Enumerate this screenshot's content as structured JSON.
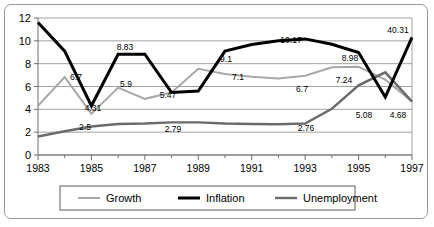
{
  "chart_data": {
    "type": "line",
    "title": "",
    "xlabel": "",
    "ylabel": "",
    "x": [
      1983,
      1984,
      1985,
      1986,
      1987,
      1988,
      1989,
      1990,
      1991,
      1992,
      1993,
      1994,
      1995,
      1996,
      1997
    ],
    "xlim": [
      1983,
      1997
    ],
    "ylim": [
      0,
      12
    ],
    "yticks": [
      0,
      2,
      4,
      6,
      8,
      10,
      12
    ],
    "xticks": [
      1983,
      1985,
      1987,
      1989,
      1991,
      1993,
      1995,
      1997
    ],
    "xtick_labels": [
      "1983",
      "1985",
      "1987",
      "1989",
      "1991",
      "1993",
      "1995",
      "1997"
    ],
    "ytick_labels": [
      "0",
      "2",
      "4",
      "6",
      "8",
      "10",
      "12"
    ],
    "grid": true,
    "legend_position": "bottom",
    "series": [
      {
        "name": "Growth",
        "color": "#a8a8a8",
        "width": 2.0,
        "values": [
          4.31,
          6.82,
          3.62,
          5.9,
          4.92,
          5.47,
          7.55,
          7.1,
          6.85,
          6.7,
          6.95,
          7.68,
          7.72,
          6.6,
          4.68
        ]
      },
      {
        "name": "Inflation",
        "color": "#000000",
        "width": 3.0,
        "values": [
          11.6,
          9.1,
          4.31,
          8.83,
          8.83,
          5.47,
          5.6,
          9.1,
          9.68,
          10.0,
          10.17,
          9.7,
          8.98,
          5.08,
          10.31
        ]
      },
      {
        "name": "Unemployment",
        "color": "#6b6b6b",
        "width": 2.4,
        "values": [
          1.62,
          2.08,
          2.5,
          2.72,
          2.76,
          2.86,
          2.86,
          2.76,
          2.72,
          2.7,
          2.76,
          4.05,
          6.1,
          7.24,
          4.68
        ]
      }
    ],
    "point_labels": [
      {
        "series": "Inflation",
        "x": 1985,
        "value": "6.7",
        "lx": 76,
        "ly": 80
      },
      {
        "series": "Growth",
        "x": 1985,
        "value": "4.31",
        "lx": 93,
        "ly": 111
      },
      {
        "series": "Growth",
        "x": 1985,
        "value": "2.5",
        "lx": 85,
        "ly": 130
      },
      {
        "series": "Inflation",
        "x": 1987,
        "value": "8.83",
        "lx": 125,
        "ly": 50
      },
      {
        "series": "Growth",
        "x": 1987,
        "value": "5.9",
        "lx": 126,
        "ly": 87
      },
      {
        "series": "Inflation",
        "x": 1989,
        "value": "5.47",
        "lx": 168,
        "ly": 98
      },
      {
        "series": "Unemployment",
        "x": 1989,
        "value": "2.79",
        "lx": 173,
        "ly": 132
      },
      {
        "series": "Inflation",
        "x": 1991,
        "value": "9.1",
        "lx": 226,
        "ly": 62
      },
      {
        "series": "Growth",
        "x": 1991,
        "value": "7.1",
        "lx": 238,
        "ly": 80
      },
      {
        "series": "Inflation",
        "x": 1993,
        "value": "10.17",
        "lx": 291,
        "ly": 43
      },
      {
        "series": "Growth",
        "x": 1993,
        "value": "6.7",
        "lx": 302,
        "ly": 92
      },
      {
        "series": "Unemployment",
        "x": 1993,
        "value": "2.76",
        "lx": 306,
        "ly": 131
      },
      {
        "series": "Inflation",
        "x": 1995,
        "value": "8.98",
        "lx": 350,
        "ly": 61
      },
      {
        "series": "Unemployment",
        "x": 1995,
        "value": "7.24",
        "lx": 344,
        "ly": 83
      },
      {
        "series": "Inflation",
        "x": 1996,
        "value": "5.08",
        "lx": 364,
        "ly": 118
      },
      {
        "series": "Growth",
        "x": 1997,
        "value": "4.68",
        "lx": 398,
        "ly": 118
      },
      {
        "series": "Inflation",
        "x": 1997,
        "value": "40.31",
        "lx": 398,
        "ly": 33
      }
    ]
  },
  "legend": {
    "items": [
      {
        "label": "Growth",
        "color": "#a8a8a8"
      },
      {
        "label": "Inflation",
        "color": "#000000"
      },
      {
        "label": "Unemployment",
        "color": "#6b6b6b"
      }
    ]
  }
}
